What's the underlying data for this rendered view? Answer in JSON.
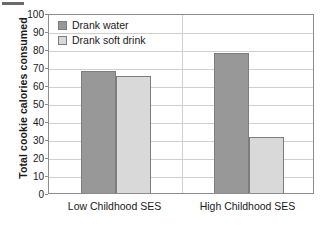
{
  "chart_data": {
    "type": "bar",
    "title": "",
    "xlabel": "",
    "ylabel": "Total cookie calories consumed",
    "categories": [
      "Low Childhood SES",
      "High Childhood SES"
    ],
    "series": [
      {
        "name": "Drank water",
        "values": [
          68,
          78
        ],
        "color": "#989898"
      },
      {
        "name": "Drank soft drink",
        "values": [
          65,
          31
        ],
        "color": "#d9d9d9"
      }
    ],
    "ylim": [
      0,
      100
    ],
    "yticks": [
      0,
      10,
      20,
      30,
      40,
      50,
      60,
      70,
      80,
      90,
      100
    ],
    "grid": true,
    "legend_position": "top-left"
  },
  "axis": {
    "y_title": "Total cookie calories consumed",
    "tick_labels": [
      "100",
      "90",
      "80",
      "70",
      "60",
      "50",
      "40",
      "30",
      "20",
      "10",
      "0"
    ]
  },
  "legend": {
    "items": [
      {
        "label": "Drank water",
        "swatch": "#989898"
      },
      {
        "label": "Drank soft drink",
        "swatch": "#d9d9d9"
      }
    ]
  },
  "categories": [
    {
      "label": "Low Childhood SES"
    },
    {
      "label": "High Childhood SES"
    }
  ],
  "colors": {
    "bar_dark": "#989898",
    "bar_light": "#d9d9d9",
    "grid": "#cfcfcf",
    "frame": "#8d8d8d",
    "text": "#1a1a1a"
  }
}
